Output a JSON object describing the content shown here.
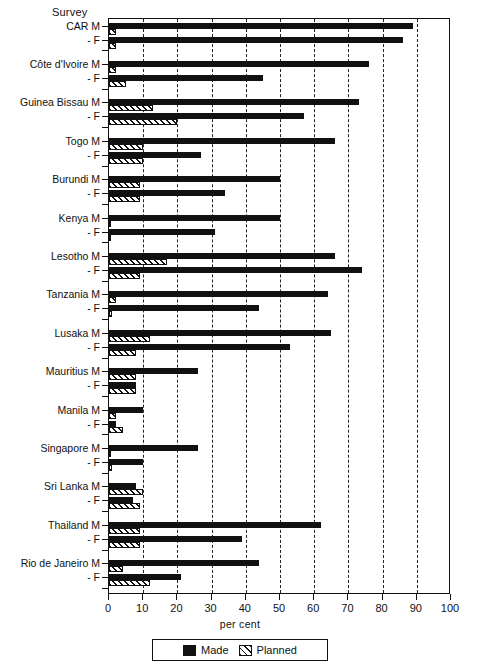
{
  "title": "Survey",
  "legend": {
    "made_label": "Made",
    "planned_label": "Planned"
  },
  "axis": {
    "xlabel": "per cent",
    "xticks": [
      "0",
      "10",
      "20",
      "30",
      "40",
      "50",
      "60",
      "70",
      "80",
      "90",
      "100"
    ]
  },
  "chart_data": {
    "type": "bar",
    "orientation": "horizontal",
    "title": "Survey",
    "xlabel": "per cent",
    "ylabel": "",
    "xlim": [
      0,
      100
    ],
    "grid": "vertical dashed gridlines every 10 per cent",
    "legend_position": "below axis, centered",
    "series": [
      {
        "name": "Made",
        "style": "solid black"
      },
      {
        "name": "Planned",
        "style": "diagonal hatch"
      }
    ],
    "categories": [
      "CAR M",
      "CAR - F",
      "Côte d'Ivoire M",
      "Côte d'Ivoire - F",
      "Guinea Bissau M",
      "Guinea Bissau - F",
      "Togo M",
      "Togo - F",
      "Burundi M",
      "Burundi - F",
      "Kenya M",
      "Kenya - F",
      "Lesotho M",
      "Lesotho - F",
      "Tanzania M",
      "Tanzania - F",
      "Lusaka M",
      "Lusaka - F",
      "Mauritius M",
      "Mauritius - F",
      "Manila M",
      "Manila - F",
      "Singapore M",
      "Singapore - F",
      "Sri Lanka M",
      "Sri Lanka - F",
      "Thailand M",
      "Thailand - F",
      "Rio de Janeiro M",
      "Rio de Janeiro - F"
    ],
    "groups": [
      {
        "country": "CAR",
        "label_m": "CAR M",
        "label_f": "- F",
        "m_made": 89,
        "m_planned": 2,
        "f_made": 86,
        "f_planned": 2
      },
      {
        "country": "Côte d'Ivoire",
        "label_m": "Côte d'Ivoire M",
        "label_f": "- F",
        "m_made": 76,
        "m_planned": 2,
        "f_made": 45,
        "f_planned": 5
      },
      {
        "country": "Guinea Bissau",
        "label_m": "Guinea Bissau M",
        "label_f": "- F",
        "m_made": 73,
        "m_planned": 13,
        "f_made": 57,
        "f_planned": 20
      },
      {
        "country": "Togo",
        "label_m": "Togo M",
        "label_f": "- F",
        "m_made": 66,
        "m_planned": 10,
        "f_made": 27,
        "f_planned": 10
      },
      {
        "country": "Burundi",
        "label_m": "Burundi M",
        "label_f": "- F",
        "m_made": 50,
        "m_planned": 9,
        "f_made": 34,
        "f_planned": 9
      },
      {
        "country": "Kenya",
        "label_m": "Kenya M",
        "label_f": "- F",
        "m_made": 50,
        "m_planned": 0,
        "f_made": 31,
        "f_planned": 0
      },
      {
        "country": "Lesotho",
        "label_m": "Lesotho M",
        "label_f": "- F",
        "m_made": 66,
        "m_planned": 17,
        "f_made": 74,
        "f_planned": 9
      },
      {
        "country": "Tanzania",
        "label_m": "Tanzania M",
        "label_f": "- F",
        "m_made": 64,
        "m_planned": 2,
        "f_made": 44,
        "f_planned": 1
      },
      {
        "country": "Lusaka",
        "label_m": "Lusaka M",
        "label_f": "- F",
        "m_made": 65,
        "m_planned": 12,
        "f_made": 53,
        "f_planned": 8
      },
      {
        "country": "Mauritius",
        "label_m": "Mauritius M",
        "label_f": "- F",
        "m_made": 26,
        "m_planned": 8,
        "f_made": 8,
        "f_planned": 8
      },
      {
        "country": "Manila",
        "label_m": "Manila M",
        "label_f": "- F",
        "m_made": 10,
        "m_planned": 2,
        "f_made": 2,
        "f_planned": 4
      },
      {
        "country": "Singapore",
        "label_m": "Singapore M",
        "label_f": "- F",
        "m_made": 26,
        "m_planned": 0,
        "f_made": 10,
        "f_planned": 1
      },
      {
        "country": "Sri Lanka",
        "label_m": "Sri Lanka M",
        "label_f": "- F",
        "m_made": 8,
        "m_planned": 10,
        "f_made": 7,
        "f_planned": 9
      },
      {
        "country": "Thailand",
        "label_m": "Thailand M",
        "label_f": "- F",
        "m_made": 62,
        "m_planned": 9,
        "f_made": 39,
        "f_planned": 9
      },
      {
        "country": "Rio de Janeiro",
        "label_m": "Rio de Janeiro M",
        "label_f": "- F",
        "m_made": 44,
        "m_planned": 4,
        "f_made": 21,
        "f_planned": 12
      }
    ]
  }
}
